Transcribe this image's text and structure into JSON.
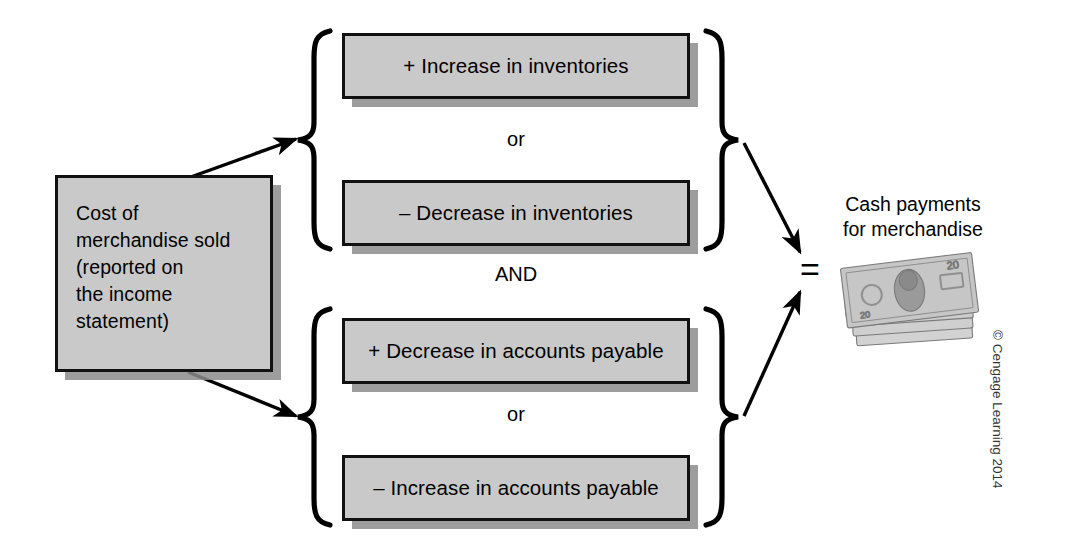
{
  "figure": {
    "source_box": {
      "lines": [
        "Cost of",
        "merchandise sold",
        "(reported on",
        "the income",
        "statement)"
      ]
    },
    "groups": [
      {
        "name": "inventories",
        "items": [
          {
            "label": "+ Increase in inventories"
          },
          {
            "label": "– Decrease in inventories"
          }
        ],
        "connector": "or"
      },
      {
        "name": "accounts-payable",
        "items": [
          {
            "label": "+ Decrease in accounts payable"
          },
          {
            "label": "– Increase in accounts payable"
          }
        ],
        "connector": "or"
      }
    ],
    "group_join": "AND",
    "equals_symbol": "=",
    "result": {
      "lines": [
        "Cash payments",
        "for merchandise"
      ],
      "image_name": "money-stack-icon",
      "bill_denomination": "20"
    },
    "credit": "© Cengage Learning 2014",
    "colors": {
      "box_fill": "#c9c9c9",
      "box_border": "#111111",
      "box_shadow": "#8c8c8c",
      "background": "#ffffff",
      "text": "#000000"
    }
  }
}
